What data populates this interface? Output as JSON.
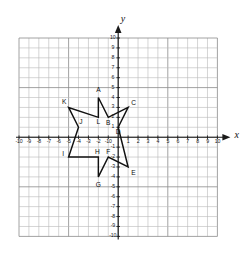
{
  "figure": {
    "type": "coordinate-grid-with-polygon",
    "background_color": "#ffffff",
    "grid_color": "#b9b9b9",
    "grid_major_color": "#8a8a8a",
    "axis_color": "#1a1a1a",
    "shape_color": "#111111"
  },
  "axes": {
    "x_label": "x",
    "y_label": "y",
    "x_min": -10,
    "x_max": 10,
    "y_min": -10,
    "y_max": 10,
    "x_tick_labels": [
      "-10",
      "-9",
      "-8",
      "-7",
      "-6",
      "-5",
      "-4",
      "-3",
      "-2",
      "-10",
      "1",
      "2",
      "3",
      "4",
      "5",
      "6",
      "7",
      "8",
      "9",
      "10"
    ],
    "x_tick_values": [
      -10,
      -9,
      -8,
      -7,
      -6,
      -5,
      -4,
      -3,
      -2,
      -1,
      1,
      2,
      3,
      4,
      5,
      6,
      7,
      8,
      9,
      10
    ],
    "y_tick_labels": [
      "10",
      "9",
      "8",
      "7",
      "6",
      "5",
      "4",
      "3",
      "2",
      "1",
      "-1",
      "-2",
      "-3",
      "-4",
      "-5",
      "-6",
      "-7",
      "-8",
      "-9",
      "-10"
    ],
    "y_tick_values": [
      10,
      9,
      8,
      7,
      6,
      5,
      4,
      3,
      2,
      1,
      -1,
      -2,
      -3,
      -4,
      -5,
      -6,
      -7,
      -8,
      -9,
      -10
    ],
    "origin_label": "0"
  },
  "chart_data": {
    "type": "scatter",
    "title": "",
    "xlabel": "x",
    "ylabel": "y",
    "xlim": [
      -10,
      10
    ],
    "ylim": [
      -10,
      10
    ],
    "grid": true,
    "legend": false,
    "shape_name": "six-pointed-star",
    "shape_closed": true,
    "points": [
      {
        "label": "A",
        "x": -2,
        "y": 4,
        "kind": "outer",
        "label_dx": 0,
        "label_dy": 0.75
      },
      {
        "label": "B",
        "x": -1,
        "y": 2,
        "kind": "inner",
        "label_dx": 0.0,
        "label_dy": -0.55
      },
      {
        "label": "C",
        "x": 1,
        "y": 3,
        "kind": "outer",
        "label_dx": 0.55,
        "label_dy": 0.45
      },
      {
        "label": "D",
        "x": 0,
        "y": 1,
        "kind": "inner",
        "label_dx": 0.0,
        "label_dy": -0.5
      },
      {
        "label": "E",
        "x": 1,
        "y": -3,
        "kind": "outer",
        "label_dx": 0.55,
        "label_dy": -0.6
      },
      {
        "label": "F",
        "x": -1,
        "y": -2,
        "kind": "inner",
        "label_dx": 0.0,
        "label_dy": 0.55
      },
      {
        "label": "G",
        "x": -2,
        "y": -4,
        "kind": "outer",
        "label_dx": 0.0,
        "label_dy": -0.8
      },
      {
        "label": "H",
        "x": -2,
        "y": -2,
        "kind": "inner",
        "label_dx": -0.1,
        "label_dy": 0.55
      },
      {
        "label": "I",
        "x": -5,
        "y": -2,
        "kind": "outer",
        "label_dx": -0.55,
        "label_dy": 0.35
      },
      {
        "label": "J",
        "x": -4,
        "y": 1,
        "kind": "inner",
        "label_dx": 0.25,
        "label_dy": 0.5
      },
      {
        "label": "K",
        "x": -5,
        "y": 3,
        "kind": "outer",
        "label_dx": -0.45,
        "label_dy": 0.5
      },
      {
        "label": "L",
        "x": -2,
        "y": 2,
        "kind": "inner",
        "label_dx": 0.0,
        "label_dy": -0.5
      }
    ],
    "outline_path": [
      {
        "x": -2,
        "y": 4
      },
      {
        "x": -1,
        "y": 2
      },
      {
        "x": 1,
        "y": 3
      },
      {
        "x": 0,
        "y": 1
      },
      {
        "x": 1,
        "y": -3
      },
      {
        "x": -1,
        "y": -2
      },
      {
        "x": -2,
        "y": -4
      },
      {
        "x": -2,
        "y": -2
      },
      {
        "x": -5,
        "y": -2
      },
      {
        "x": -4,
        "y": 1
      },
      {
        "x": -5,
        "y": 3
      },
      {
        "x": -2,
        "y": 2
      }
    ]
  }
}
